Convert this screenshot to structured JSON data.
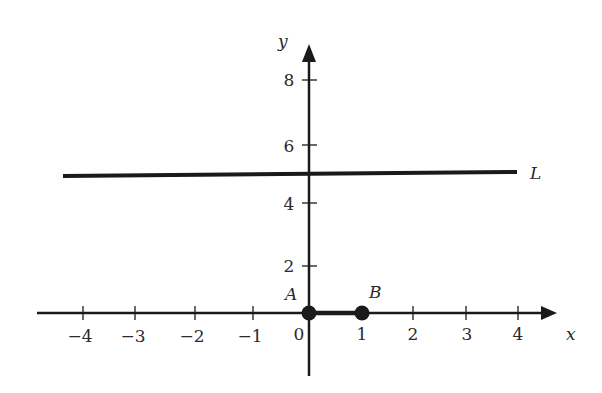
{
  "diagram": {
    "type": "coordinate-plane",
    "axes": {
      "x_label": "x",
      "y_label": "y",
      "x_ticks": [
        {
          "value": -4,
          "label": "−4"
        },
        {
          "value": -3,
          "label": "−3"
        },
        {
          "value": -2,
          "label": "−2"
        },
        {
          "value": -1,
          "label": "−1"
        },
        {
          "value": 0,
          "label": "0"
        },
        {
          "value": 1,
          "label": "1"
        },
        {
          "value": 2,
          "label": "2"
        },
        {
          "value": 3,
          "label": "3"
        },
        {
          "value": 4,
          "label": "4"
        }
      ],
      "y_ticks": [
        {
          "value": 2,
          "label": "2"
        },
        {
          "value": 4,
          "label": "4"
        },
        {
          "value": 6,
          "label": "6"
        },
        {
          "value": 8,
          "label": "8"
        }
      ]
    },
    "line": {
      "label": "L",
      "y": 5,
      "x_from": -4.2,
      "x_to": 4
    },
    "segment": {
      "from": "A",
      "to": "B"
    },
    "points": [
      {
        "label": "A",
        "x": 0,
        "y": 0
      },
      {
        "label": "B",
        "x": 1,
        "y": 0
      }
    ],
    "stroke_color": "#1a1a1a"
  }
}
